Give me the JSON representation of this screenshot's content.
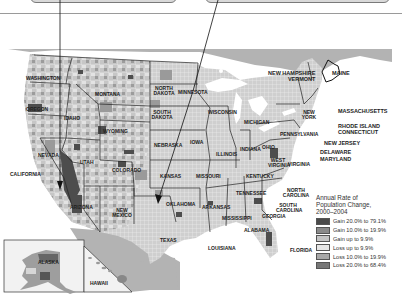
{
  "map": {
    "title": "Annual Rate of Population Change, 2000–2004",
    "legend": {
      "title_lines": [
        "Annual Rate of",
        "Population Change,",
        "2000–2004"
      ],
      "items": [
        {
          "label": "Gain 20.0% to 79.1%",
          "color": "#4a4a4a"
        },
        {
          "label": "Gain 10.0% to 19.9%",
          "color": "#8a8a8a"
        },
        {
          "label": "Gain up to 9.9%",
          "color": "#c4c4c4"
        },
        {
          "label": "Loss up to 9.9%",
          "color": "#e6e6e6"
        },
        {
          "label": "Loss 10.0% to 19.9%",
          "color": "#a8a8a8"
        },
        {
          "label": "Loss 20.0% to 68.4%",
          "color": "#777777"
        }
      ]
    },
    "state_labels": {
      "washington": "WASHINGTON",
      "oregon": "OREGON",
      "idaho": "IDAHO",
      "montana": "MONTANA",
      "wyoming": "WYOMING",
      "nevada": "NEVADA",
      "california": "CALIFORNIA",
      "utah": "UTAH",
      "colorado": "COLORADO",
      "arizona": "ARIZONA",
      "new_mexico": "NEW MEXICO",
      "north_dakota": "NORTH DAKOTA",
      "south_dakota": "SOUTH DAKOTA",
      "nebraska": "NEBRASKA",
      "kansas": "KANSAS",
      "oklahoma": "OKLAHOMA",
      "texas": "TEXAS",
      "minnesota": "MINNESOTA",
      "iowa": "IOWA",
      "missouri": "MISSOURI",
      "arkansas": "ARKANSAS",
      "louisiana": "LOUISIANA",
      "wisconsin": "WISCONSIN",
      "illinois": "ILLINOIS",
      "michigan": "MICHIGAN",
      "indiana": "INDIANA",
      "ohio": "OHIO",
      "kentucky": "KENTUCKY",
      "tennessee": "TENNESSEE",
      "mississippi": "MISSISSIPPI",
      "alabama": "ALABAMA",
      "georgia": "GEORGIA",
      "florida": "FLORIDA",
      "south_carolina": "SOUTH CAROLINA",
      "north_carolina": "NORTH CAROLINA",
      "virginia": "VIRGINIA",
      "west_virginia": "WEST VIRGINIA",
      "pennsylvania": "PENNSYLVANIA",
      "new_york": "NEW YORK",
      "maine": "MAINE",
      "nh_vt": "NEW HAMPSHIRE\nVERMONT",
      "massachusetts": "MASSACHUSETTS",
      "ri_ct": "RHODE ISLAND\nCONNECTICUT",
      "new_jersey": "NEW JERSEY",
      "delaware": "DELAWARE",
      "maryland": "MARYLAND",
      "alaska": "ALASKA",
      "hawaii": "HAWAII"
    },
    "colors": {
      "canada_mexico": "#b3b3b3",
      "water": "#ffffff",
      "county_base": "#d2d2d2",
      "state_border": "#222222"
    }
  }
}
